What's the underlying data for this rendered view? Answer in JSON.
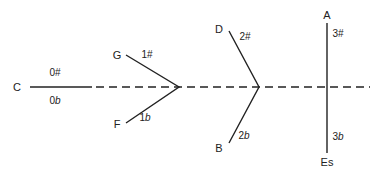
{
  "diagram": {
    "title": "",
    "line_color": "#222222",
    "keys": [
      {
        "id": "C",
        "label": "C",
        "position": "left"
      },
      {
        "id": "G",
        "label": "G",
        "accidental_num": "1",
        "accidental_sym": "#"
      },
      {
        "id": "F",
        "label": "F",
        "accidental_num": "1",
        "accidental_sym": "b"
      },
      {
        "id": "D",
        "label": "D",
        "accidental_num": "2",
        "accidental_sym": "#"
      },
      {
        "id": "B",
        "label": "B",
        "accidental_num": "2",
        "accidental_sym": "b"
      },
      {
        "id": "A",
        "label": "A",
        "accidental_num": "3",
        "accidental_sym": "#"
      },
      {
        "id": "Es",
        "label": "Es",
        "accidental_num": "3",
        "accidental_sym": "b"
      }
    ],
    "c_labels": {
      "upper_num": "0",
      "upper_sym": "#",
      "lower_num": "0",
      "lower_sym": "b"
    }
  }
}
